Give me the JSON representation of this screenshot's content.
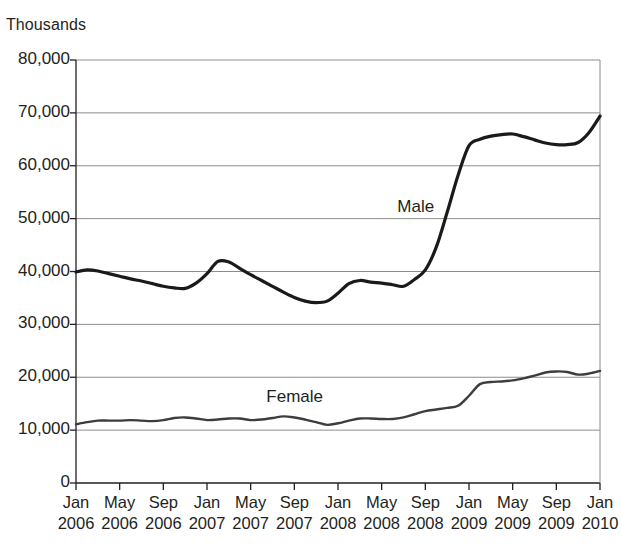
{
  "chart_data": {
    "type": "line",
    "title": "",
    "subtitle": "",
    "unit_label": "Thousands",
    "xlabel": "",
    "ylabel": "",
    "ylim": [
      0,
      80000
    ],
    "y_ticks": [
      "0",
      "10,000",
      "20,000",
      "30,000",
      "40,000",
      "50,000",
      "60,000",
      "70,000",
      "80,000"
    ],
    "y_tick_values": [
      0,
      10000,
      20000,
      30000,
      40000,
      50000,
      60000,
      70000,
      80000
    ],
    "grid": true,
    "grid_axis": "y",
    "legend_position": "inline-annotation",
    "x_tick_labels": [
      {
        "month": "Jan",
        "year": "2006"
      },
      {
        "month": "May",
        "year": "2006"
      },
      {
        "month": "Sep",
        "year": "2006"
      },
      {
        "month": "Jan",
        "year": "2007"
      },
      {
        "month": "May",
        "year": "2007"
      },
      {
        "month": "Sep",
        "year": "2007"
      },
      {
        "month": "Jan",
        "year": "2008"
      },
      {
        "month": "May",
        "year": "2008"
      },
      {
        "month": "Sep",
        "year": "2008"
      },
      {
        "month": "Jan",
        "year": "2009"
      },
      {
        "month": "May",
        "year": "2009"
      },
      {
        "month": "Sep",
        "year": "2009"
      },
      {
        "month": "Jan",
        "year": "2010"
      }
    ],
    "x": [
      "Jan 2006",
      "Feb 2006",
      "Mar 2006",
      "Apr 2006",
      "May 2006",
      "Jun 2006",
      "Jul 2006",
      "Aug 2006",
      "Sep 2006",
      "Oct 2006",
      "Nov 2006",
      "Dec 2006",
      "Jan 2007",
      "Feb 2007",
      "Mar 2007",
      "Apr 2007",
      "May 2007",
      "Jun 2007",
      "Jul 2007",
      "Aug 2007",
      "Sep 2007",
      "Oct 2007",
      "Nov 2007",
      "Dec 2007",
      "Jan 2008",
      "Feb 2008",
      "Mar 2008",
      "Apr 2008",
      "May 2008",
      "Jun 2008",
      "Jul 2008",
      "Aug 2008",
      "Sep 2008",
      "Oct 2008",
      "Nov 2008",
      "Dec 2008",
      "Jan 2009",
      "Feb 2009",
      "Mar 2009",
      "Apr 2009",
      "May 2009",
      "Jun 2009",
      "Jul 2009",
      "Aug 2009",
      "Sep 2009",
      "Oct 2009",
      "Nov 2009",
      "Dec 2009",
      "Jan 2010"
    ],
    "series": [
      {
        "name": "Male",
        "color": "#1a1a1a",
        "line_width": 3.2,
        "label_x": "Sep 2008",
        "label_value": 52000,
        "values": [
          39900,
          40300,
          40100,
          39600,
          39100,
          38600,
          38200,
          37700,
          37200,
          36900,
          36800,
          37800,
          39600,
          41900,
          41800,
          40600,
          39400,
          38300,
          37200,
          36100,
          35100,
          34400,
          34100,
          34400,
          35900,
          37700,
          38300,
          38000,
          37800,
          37500,
          37200,
          38500,
          40300,
          44600,
          51200,
          58200,
          63800,
          65000,
          65600,
          65900,
          66000,
          65500,
          64900,
          64300,
          64000,
          64000,
          64400,
          66300,
          69400
        ]
      },
      {
        "name": "Female",
        "color": "#3d3d3d",
        "line_width": 2.4,
        "label_x": "Sep 2007",
        "label_value": 16100,
        "values": [
          11100,
          11500,
          11800,
          11800,
          11800,
          11900,
          11800,
          11700,
          11900,
          12300,
          12400,
          12200,
          11900,
          12000,
          12200,
          12200,
          11900,
          12000,
          12300,
          12600,
          12400,
          12000,
          11500,
          11000,
          11300,
          11800,
          12200,
          12200,
          12100,
          12100,
          12400,
          13000,
          13600,
          13900,
          14200,
          14600,
          16500,
          18700,
          19100,
          19200,
          19400,
          19800,
          20300,
          20900,
          21100,
          21000,
          20500,
          20700,
          21200
        ]
      }
    ]
  },
  "plot": {
    "left": 76,
    "right": 600,
    "top": 60,
    "bottom": 483,
    "axis_color": "#231f20",
    "grid_color": "#8c8c8c",
    "background": "#ffffff"
  }
}
